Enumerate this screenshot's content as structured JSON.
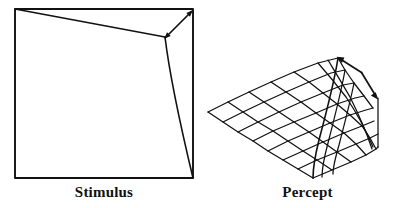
{
  "figure": {
    "title_visible": false,
    "background_color": "#ffffff",
    "ink_color": "#111111",
    "width": 399,
    "height": 208,
    "panels": [
      {
        "id": "stimulus",
        "caption": "Stimulus",
        "description": "Square outline with an internal fold line running from the top-left corner to a vertex near the top-right, then down to the bottom-right corner",
        "square": {
          "top_left": [
            15,
            9
          ],
          "top_right": [
            193,
            9
          ],
          "bottom_right": [
            193,
            178
          ],
          "bottom_left": [
            15,
            178
          ]
        },
        "fold_vertex": [
          165,
          37
        ],
        "annotation": {
          "type": "double-headed-arrow",
          "from": [
            163,
            40
          ],
          "to": [
            192,
            11
          ],
          "meaning": "dihedral angle of the fold"
        }
      },
      {
        "id": "percept",
        "caption": "Percept",
        "description": "Perspective view of a curved quadrilateral mesh surface bending upward toward a ridge on its right side",
        "grid": {
          "columns": 8,
          "rows": 7,
          "left_corner": [
            208,
            112
          ],
          "bottom_corner": [
            313,
            178
          ],
          "right_corner": [
            378,
            98
          ],
          "ridge_top": [
            338,
            58
          ]
        },
        "annotation": {
          "type": "bent-double-headed-arrow",
          "vertex": [
            362,
            73
          ],
          "head_a": [
            337,
            57
          ],
          "head_b": [
            378,
            98
          ],
          "meaning": "perceived dihedral angle of the curved surface"
        }
      }
    ]
  },
  "captions": {
    "stimulus": "Stimulus",
    "percept": "Percept"
  }
}
